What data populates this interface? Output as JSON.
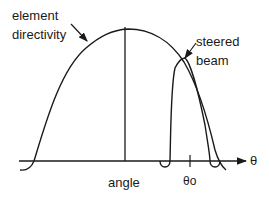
{
  "diagram": {
    "labels": {
      "element_directivity_line1": "element",
      "element_directivity_line2": "directivity",
      "steered_beam_line1": "steered",
      "steered_beam_line2": "beam",
      "x_axis": "angle",
      "theta_axis": "θ",
      "theta_zero": "θo"
    },
    "curves": [
      {
        "name": "element directivity",
        "shape": "broad dome peaking at center angle"
      },
      {
        "name": "steered beam",
        "shape": "narrow lobe centered at θo with small sidelobes"
      }
    ],
    "colors": {
      "stroke": "#1a1a1a",
      "background": "#ffffff"
    }
  }
}
